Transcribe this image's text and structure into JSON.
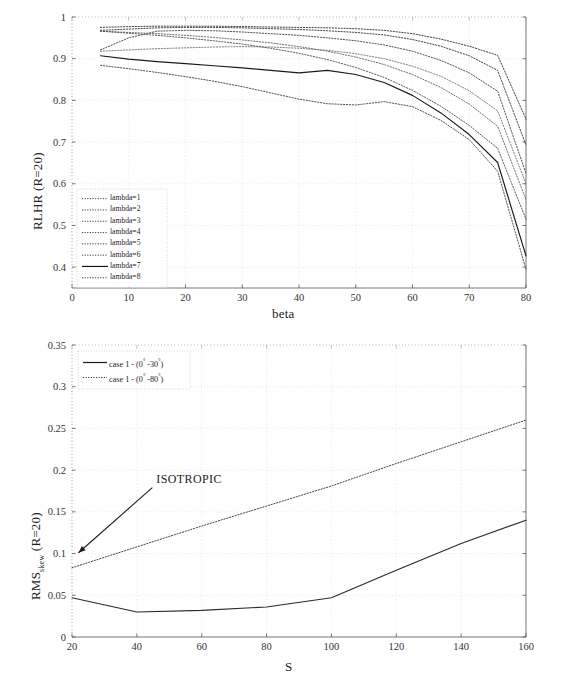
{
  "figure": {
    "panels": [
      "top",
      "bottom"
    ]
  },
  "chart_data": [
    {
      "id": "top",
      "type": "line",
      "title": "",
      "xlabel": "beta",
      "ylabel": "RLHR  (R=20)",
      "ylabel_plain": "RLHR (R=20)",
      "xlim": [
        0,
        80
      ],
      "ylim": [
        0.35,
        1
      ],
      "xticks": [
        0,
        10,
        20,
        30,
        40,
        50,
        60,
        70,
        80
      ],
      "yticks": [
        0.4,
        0.5,
        0.6,
        0.7,
        0.8,
        0.9,
        1
      ],
      "ytick_labels": [
        "0.4",
        "0.5",
        "0.6",
        "0.7",
        "0.8",
        "0.9",
        "1"
      ],
      "xtick_labels": [
        "0",
        "10",
        "20",
        "30",
        "40",
        "50",
        "60",
        "70",
        "80"
      ],
      "grid": true,
      "legend_position": "lower-left",
      "x": [
        5,
        10,
        15,
        20,
        25,
        30,
        35,
        40,
        45,
        50,
        55,
        60,
        65,
        70,
        75,
        80
      ],
      "series": [
        {
          "name": "lambda=1",
          "style": "dotted",
          "color": "#3a3a3a",
          "values": [
            0.975,
            0.977,
            0.978,
            0.978,
            0.978,
            0.977,
            0.976,
            0.975,
            0.974,
            0.972,
            0.968,
            0.96,
            0.947,
            0.93,
            0.908,
            0.755
          ]
        },
        {
          "name": "lambda=2",
          "style": "dotted",
          "color": "#3a3a3a",
          "values": [
            0.968,
            0.971,
            0.974,
            0.975,
            0.975,
            0.974,
            0.972,
            0.97,
            0.967,
            0.963,
            0.957,
            0.946,
            0.93,
            0.907,
            0.872,
            0.693
          ]
        },
        {
          "name": "lambda=3",
          "style": "dotted",
          "color": "#4a4a4a",
          "values": [
            0.921,
            0.95,
            0.966,
            0.968,
            0.967,
            0.964,
            0.96,
            0.956,
            0.95,
            0.943,
            0.933,
            0.918,
            0.896,
            0.866,
            0.822,
            0.625
          ]
        },
        {
          "name": "lambda=4",
          "style": "dotted",
          "color": "#7a7a7a",
          "values": [
            0.918,
            0.921,
            0.924,
            0.926,
            0.928,
            0.929,
            0.928,
            0.925,
            0.92,
            0.912,
            0.9,
            0.882,
            0.858,
            0.823,
            0.775,
            0.6
          ]
        },
        {
          "name": "lambda=5",
          "style": "dotted",
          "color": "#6a6a6a",
          "values": [
            0.966,
            0.963,
            0.96,
            0.956,
            0.951,
            0.945,
            0.938,
            0.929,
            0.918,
            0.904,
            0.886,
            0.862,
            0.831,
            0.791,
            0.738,
            0.562
          ]
        },
        {
          "name": "lambda=6",
          "style": "dotted",
          "color": "#555555",
          "values": [
            0.966,
            0.961,
            0.956,
            0.95,
            0.943,
            0.935,
            0.925,
            0.913,
            0.898,
            0.879,
            0.855,
            0.824,
            0.786,
            0.74,
            0.685,
            0.515
          ]
        },
        {
          "name": "lambda=7",
          "style": "solid",
          "color": "#1a1a1a",
          "values": [
            0.907,
            0.899,
            0.893,
            0.888,
            0.883,
            0.878,
            0.872,
            0.866,
            0.872,
            0.862,
            0.843,
            0.812,
            0.77,
            0.718,
            0.651,
            0.427
          ]
        },
        {
          "name": "lambda=8",
          "style": "dotted",
          "color": "#4a4a4a",
          "values": [
            0.884,
            0.876,
            0.867,
            0.857,
            0.846,
            0.833,
            0.818,
            0.803,
            0.792,
            0.789,
            0.797,
            0.785,
            0.752,
            0.706,
            0.63,
            0.395
          ]
        }
      ]
    },
    {
      "id": "bottom",
      "type": "line",
      "title": "",
      "xlabel": "S",
      "ylabel_parts": {
        "main": "RMS",
        "sub": "skew",
        "suffix": "  (R=20)"
      },
      "ylabel_plain": "RMS_skew (R=20)",
      "xlim": [
        20,
        160
      ],
      "ylim": [
        0,
        0.35
      ],
      "xticks": [
        20,
        40,
        60,
        80,
        100,
        120,
        140,
        160
      ],
      "xtick_labels": [
        "20",
        "40",
        "60",
        "80",
        "100",
        "120",
        "140",
        "160"
      ],
      "yticks": [
        0,
        0.05,
        0.1,
        0.15,
        0.2,
        0.25,
        0.3,
        0.35
      ],
      "ytick_labels": [
        "0",
        "0.05",
        "0.1",
        "0.15",
        "0.2",
        "0.25",
        "0.3",
        "0.35"
      ],
      "grid": true,
      "legend_position": "upper-left",
      "x": [
        20,
        40,
        60,
        80,
        100,
        120,
        140,
        160
      ],
      "series": [
        {
          "name": "case 1 - (0° -30°)",
          "style": "solid",
          "color": "#2a2a2a",
          "values": [
            0.047,
            0.03,
            0.032,
            0.036,
            0.047,
            0.08,
            0.112,
            0.14
          ]
        },
        {
          "name": "case 1 - (0° -80°)",
          "style": "dotted",
          "color": "#3c3c3c",
          "values": [
            0.083,
            0.108,
            0.133,
            0.157,
            0.181,
            0.208,
            0.234,
            0.26
          ]
        }
      ],
      "annotations": [
        {
          "text": "ISOTROPIC",
          "x_data": 46,
          "y_data": 0.185,
          "arrow_to_x": 22,
          "arrow_to_y": 0.101
        }
      ]
    }
  ],
  "legend_top": {
    "items": [
      {
        "label": "lambda=1",
        "style": "dotted"
      },
      {
        "label": "lambda=2",
        "style": "dotted"
      },
      {
        "label": "lambda=3",
        "style": "dotted"
      },
      {
        "label": "lambda=4",
        "style": "dotted"
      },
      {
        "label": "lambda=5",
        "style": "dotted"
      },
      {
        "label": "lambda=6",
        "style": "dotted"
      },
      {
        "label": "lambda=7",
        "style": "solid"
      },
      {
        "label": "lambda=8",
        "style": "dotted"
      }
    ]
  },
  "legend_bottom": {
    "items": [
      {
        "label_pre": "case 1 - (0",
        "deg1": "°",
        "label_mid": " -30",
        "deg2": "°",
        "label_post": ")",
        "style": "solid"
      },
      {
        "label_pre": "case 1 - (0",
        "deg1": "°",
        "label_mid": " -80",
        "deg2": "°",
        "label_post": ")",
        "style": "dotted"
      }
    ]
  }
}
